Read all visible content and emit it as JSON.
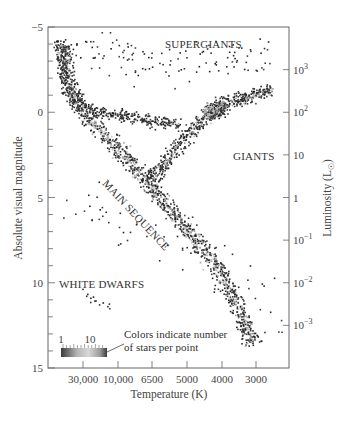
{
  "chart_data": {
    "type": "scatter",
    "title": "",
    "xlabel": "Temperature (K)",
    "ylabel": "Absolute visual magnitude",
    "y2label": "Luminosity (L☉)",
    "x_ticks": [
      {
        "label": "30,000",
        "px": 83
      },
      {
        "label": "10,000",
        "px": 118
      },
      {
        "label": "6500",
        "px": 152
      },
      {
        "label": "5000",
        "px": 187
      },
      {
        "label": "4000",
        "px": 222
      },
      {
        "label": "3000",
        "px": 256
      }
    ],
    "y_ticks": [
      {
        "label": "−5",
        "value": -5
      },
      {
        "label": "0",
        "value": 0
      },
      {
        "label": "5",
        "value": 5
      },
      {
        "label": "10",
        "value": 10
      },
      {
        "label": "15",
        "value": 15
      }
    ],
    "ylim": [
      -5,
      15
    ],
    "y2_ticks": [
      {
        "base": "10",
        "exp": "3",
        "magnitude": -2.5
      },
      {
        "base": "10",
        "exp": "2",
        "magnitude": 0
      },
      {
        "base": "10",
        "exp": "",
        "magnitude": 2.5
      },
      {
        "base": "1",
        "exp": "",
        "magnitude": 5
      },
      {
        "base": "10",
        "exp": "−1",
        "magnitude": 7.5
      },
      {
        "base": "10",
        "exp": "−2",
        "magnitude": 10
      },
      {
        "base": "10",
        "exp": "−3",
        "magnitude": 12.5
      }
    ],
    "annotations": [
      {
        "text": "SUPERGIANTS",
        "x": 165,
        "y": 48,
        "rotate": 0
      },
      {
        "text": "GIANTS",
        "x": 233,
        "y": 160,
        "rotate": 0
      },
      {
        "text": "MAIN SEQUENCE",
        "x": 102,
        "y": 184,
        "rotate": 47
      },
      {
        "text": "WHITE DWARFS",
        "x": 59,
        "y": 288,
        "rotate": 0
      }
    ],
    "colorbar": {
      "label_min": "1",
      "label_max": "10",
      "note_line1": "Colors indicate number",
      "note_line2": "of stars per point"
    },
    "grid": false,
    "legend_position": "none",
    "regions": [
      {
        "name": "main-sequence",
        "path": [
          [
            62,
            45
          ],
          [
            70,
            85
          ],
          [
            85,
            115
          ],
          [
            110,
            140
          ],
          [
            140,
            175
          ],
          [
            170,
            210
          ],
          [
            195,
            240
          ],
          [
            215,
            265
          ],
          [
            232,
            295
          ],
          [
            245,
            325
          ],
          [
            252,
            345
          ]
        ],
        "width": 16,
        "count": 1400,
        "dark": 0.45
      },
      {
        "name": "giant-branch",
        "path": [
          [
            150,
            180
          ],
          [
            170,
            155
          ],
          [
            190,
            130
          ],
          [
            210,
            112
          ],
          [
            232,
            100
          ],
          [
            255,
            95
          ],
          [
            272,
            88
          ]
        ],
        "width": 14,
        "count": 550,
        "dark": 0.55
      },
      {
        "name": "giant-clump",
        "path": [
          [
            205,
            115
          ],
          [
            215,
            108
          ],
          [
            225,
            105
          ]
        ],
        "width": 16,
        "count": 260,
        "dark": 0.35
      },
      {
        "name": "upper-left-edge",
        "path": [
          [
            60,
            40
          ],
          [
            62,
            70
          ],
          [
            70,
            100
          ],
          [
            90,
            110
          ],
          [
            120,
            115
          ],
          [
            150,
            120
          ],
          [
            180,
            125
          ]
        ],
        "width": 12,
        "count": 420,
        "dark": 0.8
      },
      {
        "name": "supergiant-scatter",
        "path": [
          [
            70,
            45
          ],
          [
            130,
            60
          ],
          [
            200,
            60
          ],
          [
            270,
            55
          ]
        ],
        "width": 40,
        "count": 120,
        "dark": 0.95
      },
      {
        "name": "white-dwarfs",
        "path": [
          [
            78,
            292
          ],
          [
            95,
            300
          ],
          [
            112,
            308
          ]
        ],
        "width": 10,
        "count": 13,
        "dark": 1.0
      },
      {
        "name": "field-scatter",
        "path": [
          [
            60,
            190
          ],
          [
            120,
            230
          ],
          [
            200,
            260
          ],
          [
            260,
            300
          ],
          [
            275,
            340
          ]
        ],
        "width": 60,
        "count": 60,
        "dark": 1.0
      }
    ]
  }
}
